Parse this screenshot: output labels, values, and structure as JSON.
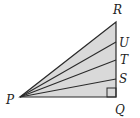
{
  "diagram": {
    "type": "geometry-figure",
    "colors": {
      "fill": "#d9d9d9",
      "stroke": "#2a2a2a"
    },
    "vertices": [
      {
        "id": "P",
        "label": "P"
      },
      {
        "id": "Q",
        "label": "Q"
      },
      {
        "id": "R",
        "label": "R"
      },
      {
        "id": "S",
        "label": "S"
      },
      {
        "id": "T",
        "label": "T"
      },
      {
        "id": "U",
        "label": "U"
      }
    ],
    "segments": [
      "PQ",
      "QR",
      "PR",
      "PS",
      "PT",
      "PU"
    ],
    "right_angle_at": "Q"
  }
}
